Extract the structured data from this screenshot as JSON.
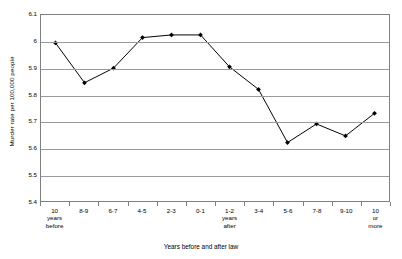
{
  "chart_data": {
    "type": "line",
    "title": "",
    "xlabel": "Years before and after law",
    "ylabel": "Murder rate per 100,000 people",
    "ylim": [
      5.4,
      6.1
    ],
    "ytick_values": [
      "6.1",
      "6",
      "5.9",
      "5.8",
      "5.7",
      "5.6",
      "5.5",
      "5.4"
    ],
    "ytick_numbers": [
      6.1,
      6.0,
      5.9,
      5.8,
      5.7,
      5.6,
      5.5,
      5.4
    ],
    "grid": true,
    "legend": "none",
    "marker": "diamond",
    "line_color": "#000000",
    "marker_color": "#000000",
    "grid_color": "#9a9a9a",
    "axis_color": "#808080",
    "categories": [
      {
        "line1": "10",
        "line2": "years",
        "line3": "before"
      },
      {
        "line1": "8-9",
        "line2": "",
        "line3": ""
      },
      {
        "line1": "6-7",
        "line2": "",
        "line3": ""
      },
      {
        "line1": "4-5",
        "line2": "",
        "line3": ""
      },
      {
        "line1": "2-3",
        "line2": "",
        "line3": ""
      },
      {
        "line1": "0-1",
        "line2": "",
        "line3": ""
      },
      {
        "line1": "1-2",
        "line2": "years",
        "line3": "after"
      },
      {
        "line1": "3-4",
        "line2": "",
        "line3": ""
      },
      {
        "line1": "5-6",
        "line2": "",
        "line3": ""
      },
      {
        "line1": "7-8",
        "line2": "",
        "line3": ""
      },
      {
        "line1": "9-10",
        "line2": "",
        "line3": ""
      },
      {
        "line1": "10",
        "line2": "or",
        "line3": "more"
      }
    ],
    "values": [
      5.995,
      5.845,
      5.9,
      6.015,
      6.025,
      6.025,
      5.905,
      5.82,
      5.62,
      5.69,
      5.645,
      5.73
    ]
  }
}
